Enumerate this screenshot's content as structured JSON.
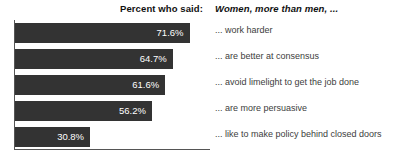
{
  "header": {
    "left_label": "Percent who said:",
    "right_label": "Women, more than men, ..."
  },
  "chart_data": {
    "type": "bar",
    "orientation": "horizontal",
    "title": "Percent who said: Women, more than men, ...",
    "xlabel": "",
    "ylabel": "",
    "xlim": [
      0,
      80
    ],
    "grid": false,
    "legend": "none",
    "value_label_position": "inside-right",
    "bar_color": "#333333",
    "axis_color": "#555555",
    "value_label_color": "#ffffff",
    "category_label_color": "#3d3d3d",
    "categories": [
      "... work harder",
      "... are better at consensus",
      "... avoid limelight to get the job done",
      "... are more persuasive",
      "... like to make policy behind closed doors"
    ],
    "values": [
      71.6,
      64.7,
      61.6,
      56.2,
      30.8
    ],
    "value_labels": [
      "71.6%",
      "64.7%",
      "61.6%",
      "56.2%",
      "30.8%"
    ]
  }
}
